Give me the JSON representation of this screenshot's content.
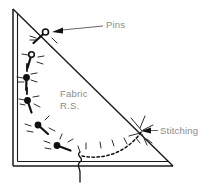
{
  "figure": {
    "domain": "sewing-instruction-diagram",
    "canvas": {
      "width": 212,
      "height": 188,
      "background": "#ffffff"
    },
    "colors": {
      "outline": "#1a1a1a",
      "pin": "#111111",
      "stitching": "#111111",
      "label_text": "#8a8a8a",
      "leader_line": "#555555",
      "sparkle": "#333333"
    },
    "labels": [
      {
        "id": "pins",
        "text": "Pins",
        "x": 106,
        "y": 25,
        "anchor": "start",
        "leader": {
          "from_x": 103,
          "from_y": 26,
          "to_x": 52,
          "to_y": 32,
          "arrow": true
        }
      },
      {
        "id": "fabric-line-1",
        "text": "Fabric",
        "x": 60,
        "y": 97,
        "anchor": "start",
        "leader": null
      },
      {
        "id": "fabric-line-2",
        "text": "R.S.",
        "x": 60,
        "y": 109,
        "anchor": "start",
        "leader": null
      },
      {
        "id": "stitching",
        "text": "Stitching",
        "x": 160,
        "y": 133,
        "anchor": "start",
        "leader": {
          "from_x": 158,
          "from_y": 130,
          "to_x": 142,
          "to_y": 131,
          "arrow": true
        }
      }
    ],
    "fabric_triangle": {
      "description": "Right triangle, right angle at bottom-left; vertical left edge, horizontal bottom edge, hypotenuse from top-left to bottom-right. Edges drawn as double lines (fold / seam allowance).",
      "vertices": [
        {
          "name": "top-left",
          "x": 13,
          "y": 9
        },
        {
          "name": "bottom-left",
          "x": 13,
          "y": 166
        },
        {
          "name": "bottom-right",
          "x": 173,
          "y": 166
        }
      ],
      "inner_offset_px": 4,
      "double_edges": [
        "left",
        "bottom"
      ],
      "single_edges": [
        "hypotenuse"
      ]
    },
    "pins": {
      "count": 7,
      "description": "Pins set along a curved (quarter-circle) line from the hypotenuse near the top down and around toward the bottom edge; each pin has a round head, an angled shaft and radiating sparkle strokes.",
      "items": [
        {
          "index": 1,
          "head_x": 45.5,
          "head_y": 32.0,
          "tip_x": 33.5,
          "tip_y": 43.0,
          "head_r": 3.0,
          "filled": false
        },
        {
          "index": 2,
          "head_x": 31.5,
          "head_y": 54.5,
          "tip_x": 27.5,
          "tip_y": 68.0,
          "head_r": 2.8,
          "filled": false
        },
        {
          "index": 3,
          "head_x": 26.5,
          "head_y": 77.5,
          "tip_x": 26.0,
          "tip_y": 90.0,
          "head_r": 2.8,
          "filled": true
        },
        {
          "index": 4,
          "head_x": 27.5,
          "head_y": 100.5,
          "tip_x": 31.5,
          "tip_y": 112.5,
          "head_r": 2.8,
          "filled": true
        },
        {
          "index": 5,
          "head_x": 38.0,
          "head_y": 125.0,
          "tip_x": 48.0,
          "tip_y": 134.0,
          "head_r": 2.8,
          "filled": true
        },
        {
          "index": 6,
          "head_x": 57.0,
          "head_y": 145.5,
          "tip_x": 70.5,
          "tip_y": 150.5,
          "head_r": 2.8,
          "filled": true
        },
        {
          "index": 7,
          "head_x": 26.0,
          "head_y": 90.0,
          "tip_x": 26.0,
          "tip_y": 90.0,
          "head_r": 0.0,
          "filled": false
        }
      ]
    },
    "stitching_line": {
      "style": "dashed",
      "dash_pattern": "2.5 2.5",
      "description": "Dashed curved stitch line running from the bottom-centre squiggle rightward and up to the hypotenuse near the bottom-right, where the Stitching arrow points.",
      "path": "M 82,156 C 102,160 126,154 142,131",
      "end_point": {
        "x": 142,
        "y": 131
      }
    },
    "thread_squiggle": {
      "description": "Small vertical wavy thread mark crossing the bottom edge at the centre.",
      "x": 80,
      "y_top": 152,
      "y_bottom": 182
    },
    "sparkles": {
      "description": "Short radiating strokes around each pin head and along the stitched curve indicating fabric gathering/tension.",
      "stroke_length_px": 6
    }
  }
}
